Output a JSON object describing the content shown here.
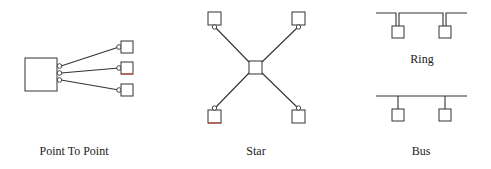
{
  "diagram": {
    "topologies": [
      {
        "name": "point-to-point",
        "label": "Point To Point"
      },
      {
        "name": "star",
        "label": "Star"
      },
      {
        "name": "ring",
        "label": "Ring"
      },
      {
        "name": "bus",
        "label": "Bus"
      }
    ]
  },
  "colors": {
    "stroke": "#333333",
    "accent_red": "#c0392b",
    "background": "#ffffff"
  }
}
